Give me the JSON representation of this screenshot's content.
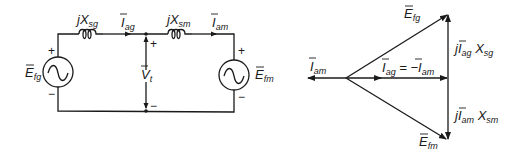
{
  "circuit": {
    "reactance_gen": {
      "prefix": "jX",
      "sub": "sg"
    },
    "reactance_motor": {
      "prefix": "jX",
      "sub": "sm"
    },
    "current_gen": {
      "main": "I",
      "sub": "ag"
    },
    "current_motor": {
      "main": "I",
      "sub": "am"
    },
    "source_gen": {
      "main": "E",
      "sub": "fg",
      "plus": "+",
      "minus": "−"
    },
    "source_motor": {
      "main": "E",
      "sub": "fm",
      "plus": "+",
      "minus": "−"
    },
    "terminal_voltage": {
      "main": "V",
      "sub": "t",
      "plus": "+",
      "minus": "−"
    }
  },
  "phasor": {
    "i_am": {
      "main": "I",
      "sub": "am"
    },
    "i_ag_eq": {
      "main": "I",
      "sub": "ag",
      "eq": " = −",
      "main2": "I",
      "sub2": "am"
    },
    "e_fg": {
      "main": "E",
      "sub": "fg"
    },
    "e_fm": {
      "main": "E",
      "sub": "fm"
    },
    "drop_gen": {
      "j": "j",
      "main": "I",
      "sub": "ag",
      "x": " X",
      "xsub": "sg"
    },
    "drop_motor": {
      "j": "j",
      "main": "I",
      "sub": "am",
      "x": " X",
      "xsub": "sm"
    }
  }
}
